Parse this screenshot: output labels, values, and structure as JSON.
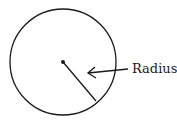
{
  "diagram": {
    "label": "Radius",
    "circle": {
      "cx": 63,
      "cy": 62,
      "r": 53
    },
    "center_dot": {
      "cx": 63,
      "cy": 62
    },
    "radius_line": {
      "x1": 63,
      "y1": 62,
      "x2": 96,
      "y2": 101
    },
    "arrow": {
      "x1": 128,
      "y1": 69,
      "x2": 88,
      "y2": 73
    },
    "colors": {
      "stroke": "#1a1a1a",
      "background": "#ffffff"
    }
  }
}
